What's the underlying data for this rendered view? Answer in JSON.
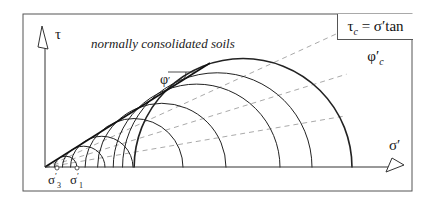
{
  "diagram": {
    "formula": "τc = σ′tan φ′c",
    "formula_parts": {
      "lhs": "τ",
      "lhs_sub": "c",
      "rhs": "= σ′tan φ′",
      "rhs_sub": "c"
    },
    "annotation": "normally consolidated soils",
    "y_axis_label": "τ",
    "x_axis_label": "σ′",
    "angle_label": "φ′c",
    "point_labels": [
      "σ′3",
      "σ′1"
    ],
    "colors": {
      "line": "#222222",
      "dashed": "#aaaaaa",
      "frame": "#555555"
    },
    "circles_right_ends_px": [
      77,
      105,
      133,
      183,
      226,
      280,
      312,
      352
    ]
  }
}
